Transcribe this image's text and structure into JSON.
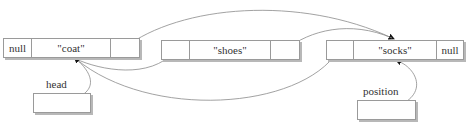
{
  "diagram": {
    "type": "doubly-linked-list",
    "nodes": [
      {
        "prev": "null",
        "value": "\"coat\"",
        "next": ""
      },
      {
        "prev": "",
        "value": "\"shoes\"",
        "next": ""
      },
      {
        "prev": "",
        "value": "\"socks\"",
        "next": "null"
      }
    ],
    "pointers": [
      {
        "label": "head",
        "target": "\"coat\""
      },
      {
        "label": "position",
        "target": "\"socks\""
      }
    ],
    "colors": {
      "line": "#8a8a8a",
      "border": "#9a9a9a",
      "shadow": "#b8b8b8",
      "arrow": "#111111"
    }
  }
}
